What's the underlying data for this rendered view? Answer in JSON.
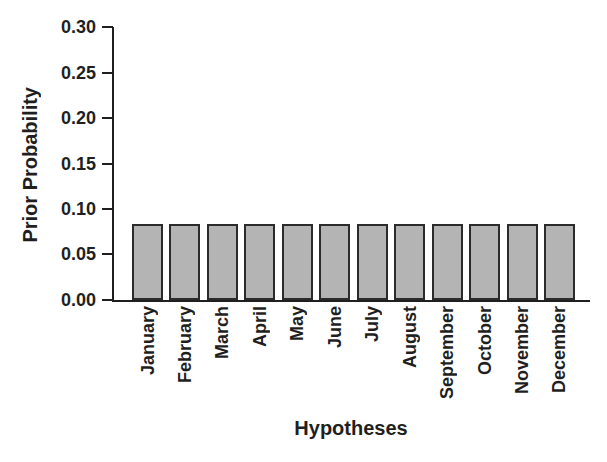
{
  "figure": {
    "background": "#ffffff",
    "text_color": "#1f1f1f"
  },
  "chart_data": {
    "type": "bar",
    "title": "",
    "xlabel": "Hypotheses",
    "ylabel": "Prior Probability",
    "categories": [
      "January",
      "February",
      "March",
      "April",
      "May",
      "June",
      "July",
      "August",
      "September",
      "October",
      "November",
      "December"
    ],
    "values": [
      0.0833,
      0.0833,
      0.0833,
      0.0833,
      0.0833,
      0.0833,
      0.0833,
      0.0833,
      0.0833,
      0.0833,
      0.0833,
      0.0833
    ],
    "ylim": [
      0,
      0.3
    ],
    "ytick_labels": [
      "0.00",
      "0.05",
      "0.10",
      "0.15",
      "0.20",
      "0.25",
      "0.30"
    ],
    "grid": false,
    "legend_position": "none",
    "bar_fill": "#b4b4b4",
    "bar_border": "#2b2b2b",
    "axis_color": "#1f1f1f"
  }
}
